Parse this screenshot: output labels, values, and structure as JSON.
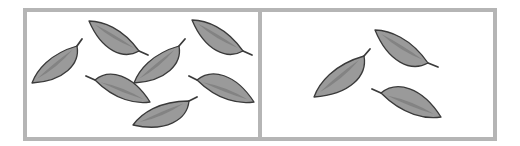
{
  "colors": {
    "background": "#ffffff",
    "frame": "#b5b5b5",
    "leaf_fill": "#9a9a9a",
    "leaf_vein": "#7d7d7d",
    "leaf_outline": "#3a3a3a"
  },
  "panels": [
    {
      "name": "left-panel",
      "x": 25,
      "y": 10,
      "width": 235,
      "height": 129,
      "leaf_count": 7,
      "leaves": [
        {
          "tip": [
            32,
            83
          ],
          "base": [
            77,
            46
          ],
          "stem_end": [
            82,
            39
          ]
        },
        {
          "tip": [
            89,
            21
          ],
          "base": [
            139,
            51
          ],
          "stem_end": [
            148,
            55
          ]
        },
        {
          "tip": [
            134,
            83
          ],
          "base": [
            179,
            46
          ],
          "stem_end": [
            185,
            39
          ]
        },
        {
          "tip": [
            192,
            20
          ],
          "base": [
            243,
            51
          ],
          "stem_end": [
            252,
            55
          ]
        },
        {
          "tip": [
            150,
            102
          ],
          "base": [
            95,
            80
          ],
          "stem_end": [
            86,
            76
          ]
        },
        {
          "tip": [
            133,
            125
          ],
          "base": [
            189,
            101
          ],
          "stem_end": [
            197,
            97
          ]
        },
        {
          "tip": [
            254,
            102
          ],
          "base": [
            197,
            80
          ],
          "stem_end": [
            189,
            76
          ]
        }
      ]
    },
    {
      "name": "right-panel",
      "x": 260,
      "y": 10,
      "width": 235,
      "height": 129,
      "leaf_count": 3,
      "leaves": [
        {
          "tip": [
            314,
            97
          ],
          "base": [
            364,
            56
          ],
          "stem_end": [
            370,
            49
          ]
        },
        {
          "tip": [
            375,
            30
          ],
          "base": [
            428,
            63
          ],
          "stem_end": [
            438,
            67
          ]
        },
        {
          "tip": [
            441,
            117
          ],
          "base": [
            381,
            93
          ],
          "stem_end": [
            372,
            89
          ]
        }
      ]
    }
  ]
}
